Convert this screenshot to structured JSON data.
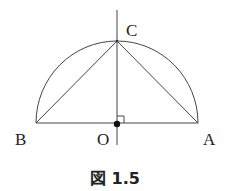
{
  "figure": {
    "caption": "図 1.5",
    "points": {
      "A": {
        "label": "A"
      },
      "B": {
        "label": "B"
      },
      "C": {
        "label": "C"
      },
      "O": {
        "label": "O"
      }
    }
  }
}
